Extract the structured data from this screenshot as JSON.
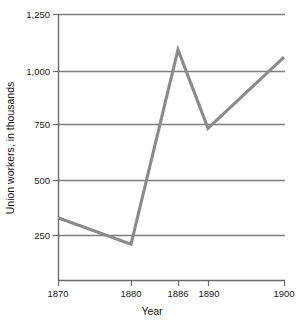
{
  "chart_data": {
    "type": "line",
    "title": "",
    "xlabel": "Year",
    "ylabel": "Union workers, in thousands",
    "x": [
      1870,
      1880,
      1886,
      1890,
      1900
    ],
    "xtick_labels": [
      "1870",
      "1880",
      "1886",
      "1890",
      "1900"
    ],
    "values": [
      295,
      170,
      1085,
      715,
      1050
    ],
    "series": [
      {
        "name": "Union workers",
        "values": [
          295,
          170,
          1085,
          715,
          1050
        ]
      }
    ],
    "ytick_values": [
      250,
      500,
      750,
      1000,
      1250
    ],
    "ytick_labels": [
      "250",
      "500",
      "750",
      "1,000",
      "1,250"
    ],
    "ylim": [
      0,
      1250
    ],
    "xlim": [
      1870,
      1900
    ],
    "grid": "horizontal",
    "legend": "none",
    "line_color": "#8a8a8a",
    "axis_color": "#6b6b6b",
    "grid_color": "#7d7d7d"
  },
  "axes": {
    "y_title": "Union workers, in thousands",
    "x_title": "Year"
  },
  "ticks": {
    "y": [
      {
        "label": "1,250",
        "value": 1250
      },
      {
        "label": "1,000",
        "value": 1000
      },
      {
        "label": "750",
        "value": 750
      },
      {
        "label": "500",
        "value": 500
      },
      {
        "label": "250",
        "value": 250
      }
    ],
    "x": [
      {
        "label": "1870",
        "value": 1870
      },
      {
        "label": "1880",
        "value": 1880
      },
      {
        "label": "1886",
        "value": 1886
      },
      {
        "label": "1890",
        "value": 1890
      },
      {
        "label": "1900",
        "value": 1900
      }
    ]
  }
}
